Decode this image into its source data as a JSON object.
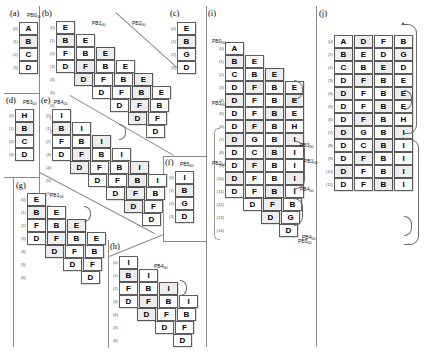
{
  "figure": {
    "title_caption": "",
    "alphabet_note": ""
  },
  "panels": [
    {
      "id": "a",
      "label": "(a)",
      "tag": "PB0",
      "tag_sub": "00",
      "type": "column",
      "rows": [
        {
          "index": "(0)",
          "offset": 0,
          "cells": [
            "A"
          ]
        },
        {
          "index": "(1)",
          "offset": 0,
          "cells": [
            "B"
          ]
        },
        {
          "index": "(2)",
          "offset": 0,
          "cells": [
            "C"
          ]
        },
        {
          "index": "(3)",
          "offset": 0,
          "cells": [
            "D"
          ]
        }
      ]
    },
    {
      "id": "b",
      "label": "(b)",
      "tag": "PB1",
      "tag_sub": "00",
      "type": "staircase",
      "rows": [
        {
          "index": "(0)",
          "offset": 0,
          "cells": [
            "E"
          ]
        },
        {
          "index": "(1)",
          "offset": 0,
          "cells": [
            "B",
            "E"
          ]
        },
        {
          "index": "(2)",
          "offset": 0,
          "cells": [
            "F",
            "B",
            "E"
          ]
        },
        {
          "index": "(3)",
          "offset": 0,
          "cells": [
            "D",
            "F",
            "B",
            "E"
          ]
        },
        {
          "index": "(4)",
          "offset": 1,
          "cells": [
            "D",
            "F",
            "B",
            "E"
          ]
        },
        {
          "index": "(5)",
          "offset": 2,
          "cells": [
            "D",
            "F",
            "B",
            "E"
          ]
        },
        {
          "index": "(6)",
          "offset": 3,
          "cells": [
            "D",
            "F",
            "B"
          ]
        },
        {
          "index": "(7)",
          "offset": 4,
          "cells": [
            "D",
            "F"
          ]
        },
        {
          "index": "(8)",
          "offset": 5,
          "cells": [
            "D"
          ]
        }
      ]
    },
    {
      "id": "c",
      "label": "(c)",
      "tag": "PB2",
      "tag_sub": "00",
      "type": "column",
      "rows": [
        {
          "index": "(0)",
          "offset": 0,
          "cells": [
            "E"
          ]
        },
        {
          "index": "(1)",
          "offset": 0,
          "cells": [
            "B"
          ]
        },
        {
          "index": "(2)",
          "offset": 0,
          "cells": [
            "G"
          ]
        },
        {
          "index": "(3)",
          "offset": 0,
          "cells": [
            "D"
          ]
        }
      ]
    },
    {
      "id": "d",
      "label": "(d)",
      "tag": "PB3",
      "tag_sub": "00",
      "type": "column",
      "rows": [
        {
          "index": "(0)",
          "offset": 0,
          "cells": [
            "H"
          ]
        },
        {
          "index": "(1)",
          "offset": 0,
          "cells": [
            "B"
          ]
        },
        {
          "index": "(2)",
          "offset": 0,
          "cells": [
            "C"
          ]
        },
        {
          "index": "(3)",
          "offset": 0,
          "cells": [
            "D"
          ]
        }
      ]
    },
    {
      "id": "e",
      "label": "(e)",
      "tag": "PB4",
      "tag_sub": "00",
      "type": "staircase",
      "rows": [
        {
          "index": "(0)",
          "offset": 0,
          "cells": [
            "I"
          ]
        },
        {
          "index": "(1)",
          "offset": 0,
          "cells": [
            "B",
            "I"
          ]
        },
        {
          "index": "(2)",
          "offset": 0,
          "cells": [
            "F",
            "B",
            "I"
          ]
        },
        {
          "index": "(3)",
          "offset": 0,
          "cells": [
            "D",
            "F",
            "B",
            "I"
          ]
        },
        {
          "index": "(4)",
          "offset": 1,
          "cells": [
            "D",
            "F",
            "B",
            "I"
          ]
        },
        {
          "index": "(5)",
          "offset": 2,
          "cells": [
            "D",
            "F",
            "B",
            "I"
          ]
        },
        {
          "index": "(6)",
          "offset": 3,
          "cells": [
            "D",
            "F",
            "B"
          ]
        },
        {
          "index": "(7)",
          "offset": 4,
          "cells": [
            "D",
            "F"
          ]
        },
        {
          "index": "(8)",
          "offset": 5,
          "cells": [
            "D"
          ]
        }
      ]
    },
    {
      "id": "f",
      "label": "(f)",
      "tag": "PB5",
      "tag_sub": "00",
      "type": "column",
      "rows": [
        {
          "index": "(0)",
          "offset": 0,
          "cells": [
            "I"
          ]
        },
        {
          "index": "(1)",
          "offset": 0,
          "cells": [
            "B"
          ]
        },
        {
          "index": "(2)",
          "offset": 0,
          "cells": [
            "G"
          ]
        },
        {
          "index": "(3)",
          "offset": 0,
          "cells": [
            "D"
          ]
        }
      ]
    },
    {
      "id": "g",
      "label": "(g)",
      "tag": "PB1",
      "tag_sub": "00",
      "type": "staircase",
      "rows": [
        {
          "index": "(0)",
          "offset": 0,
          "cells": [
            "E"
          ]
        },
        {
          "index": "(1)",
          "offset": 0,
          "cells": [
            "B",
            "E"
          ]
        },
        {
          "index": "(2)",
          "offset": 0,
          "cells": [
            "F",
            "B",
            "E"
          ]
        },
        {
          "index": "(3)",
          "offset": 0,
          "cells": [
            "D",
            "F",
            "B",
            "E"
          ]
        },
        {
          "index": "(4)",
          "offset": 1,
          "cells": [
            "D",
            "F",
            "B"
          ]
        },
        {
          "index": "(5)",
          "offset": 2,
          "cells": [
            "D",
            "F"
          ]
        },
        {
          "index": "(6)",
          "offset": 3,
          "cells": [
            "D"
          ]
        }
      ]
    },
    {
      "id": "h",
      "label": "(h)",
      "tag": "PB4",
      "tag_sub": "00",
      "type": "staircase",
      "rows": [
        {
          "index": "(0)",
          "offset": 0,
          "cells": [
            "I"
          ]
        },
        {
          "index": "(1)",
          "offset": 0,
          "cells": [
            "B",
            "I"
          ]
        },
        {
          "index": "(2)",
          "offset": 0,
          "cells": [
            "F",
            "B",
            "I"
          ]
        },
        {
          "index": "(3)",
          "offset": 0,
          "cells": [
            "D",
            "F",
            "B",
            "I"
          ]
        },
        {
          "index": "(4)",
          "offset": 1,
          "cells": [
            "D",
            "F",
            "B"
          ]
        },
        {
          "index": "(5)",
          "offset": 2,
          "cells": [
            "D",
            "F"
          ]
        },
        {
          "index": "(6)",
          "offset": 3,
          "cells": [
            "D"
          ]
        }
      ]
    },
    {
      "id": "i",
      "label": "(i)",
      "tag": "",
      "tag_sub": "",
      "type": "staircase",
      "rows": [
        {
          "index": "(0)",
          "offset": 0,
          "cells": [
            "A"
          ]
        },
        {
          "index": "(1)",
          "offset": 0,
          "cells": [
            "B",
            "E"
          ]
        },
        {
          "index": "(2)",
          "offset": 0,
          "cells": [
            "C",
            "B",
            "E"
          ]
        },
        {
          "index": "(3)",
          "offset": 0,
          "cells": [
            "D",
            "F",
            "B",
            "E"
          ]
        },
        {
          "index": "(4)",
          "offset": 0,
          "cells": [
            "D",
            "F",
            "B",
            "E"
          ]
        },
        {
          "index": "(5)",
          "offset": 0,
          "cells": [
            "D",
            "F",
            "B",
            "E"
          ]
        },
        {
          "index": "(6)",
          "offset": 0,
          "cells": [
            "D",
            "F",
            "B",
            "H"
          ]
        },
        {
          "index": "(7)",
          "offset": 0,
          "cells": [
            "D",
            "G",
            "B",
            "I"
          ]
        },
        {
          "index": "(8)",
          "offset": 0,
          "cells": [
            "D",
            "C",
            "B",
            "I"
          ]
        },
        {
          "index": "(9)",
          "offset": 0,
          "cells": [
            "D",
            "F",
            "B",
            "I"
          ]
        },
        {
          "index": "(10)",
          "offset": 0,
          "cells": [
            "D",
            "F",
            "B",
            "I"
          ]
        },
        {
          "index": "(11)",
          "offset": 0,
          "cells": [
            "D",
            "F",
            "B",
            "I"
          ]
        },
        {
          "index": "(12)",
          "offset": 1,
          "cells": [
            "D",
            "F",
            "B"
          ]
        },
        {
          "index": "(13)",
          "offset": 2,
          "cells": [
            "D",
            "G"
          ]
        },
        {
          "index": "(14)",
          "offset": 3,
          "cells": [
            "D"
          ]
        }
      ]
    },
    {
      "id": "j",
      "label": "(j)",
      "tag": "",
      "tag_sub": "",
      "type": "grid",
      "rows": [
        {
          "index": "(0)",
          "offset": 0,
          "cells": [
            "A",
            "D",
            "F",
            "B"
          ]
        },
        {
          "index": "(1)",
          "offset": 0,
          "cells": [
            "B",
            "E",
            "D",
            "G"
          ]
        },
        {
          "index": "(2)",
          "offset": 0,
          "cells": [
            "C",
            "B",
            "E",
            "D"
          ]
        },
        {
          "index": "(3)",
          "offset": 0,
          "cells": [
            "D",
            "F",
            "B",
            "E"
          ]
        },
        {
          "index": "(4)",
          "offset": 0,
          "cells": [
            "D",
            "F",
            "B",
            "E"
          ]
        },
        {
          "index": "(5)",
          "offset": 0,
          "cells": [
            "D",
            "F",
            "B",
            "E"
          ]
        },
        {
          "index": "(6)",
          "offset": 0,
          "cells": [
            "D",
            "F",
            "B",
            "H"
          ]
        },
        {
          "index": "(7)",
          "offset": 0,
          "cells": [
            "D",
            "G",
            "B",
            "I"
          ]
        },
        {
          "index": "(8)",
          "offset": 0,
          "cells": [
            "D",
            "C",
            "B",
            "I"
          ]
        },
        {
          "index": "(9)",
          "offset": 0,
          "cells": [
            "D",
            "F",
            "B",
            "I"
          ]
        },
        {
          "index": "(10)",
          "offset": 0,
          "cells": [
            "D",
            "F",
            "B",
            "I"
          ]
        },
        {
          "index": "(11)",
          "offset": 0,
          "cells": [
            "D",
            "F",
            "B",
            "I"
          ]
        }
      ]
    }
  ],
  "side_tags": {
    "i_tags": [
      "PB0",
      "PB1",
      "PB2",
      "PB3",
      "PB4",
      "PB5"
    ],
    "j_tags": [
      "PB1",
      "PB4"
    ]
  },
  "colors": {
    "cell_border": "#5d5d5d",
    "cell_fill": "#fdfdfd",
    "cell_shaded": "#ededed",
    "divider": "#8a8a8a",
    "background": "#ffffff"
  }
}
